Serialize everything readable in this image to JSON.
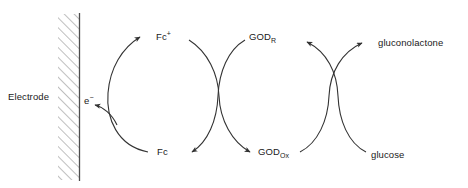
{
  "diagram": {
    "type": "reaction-cycle-diagram",
    "background_color": "#ffffff",
    "stroke_color": "#333333",
    "text_color": "#1a1a1a",
    "electrode": {
      "label": "Electrode",
      "style": "hatched-bar",
      "hatch_color": "#888888",
      "edge_color": "#555555"
    },
    "labels": {
      "electron": "e",
      "electron_charge": "−",
      "mediator_oxidized": "Fc",
      "mediator_oxidized_charge": "+",
      "mediator_reduced": "Fc",
      "enzyme_reduced": "GOD",
      "enzyme_reduced_sub": "R",
      "enzyme_oxidized": "GOD",
      "enzyme_oxidized_sub": "Ox",
      "product": "gluconolactone",
      "substrate": "glucose"
    },
    "cycles": [
      {
        "name": "mediator-cycle",
        "species": [
          "Fc+",
          "Fc"
        ],
        "direction": "counter-clockwise"
      },
      {
        "name": "enzyme-cycle",
        "species": [
          "GODR",
          "GODOx"
        ],
        "direction": "clockwise"
      },
      {
        "name": "substrate-cycle",
        "species": [
          "glucose",
          "gluconolactone"
        ],
        "direction": "crossing"
      }
    ],
    "arrows": [
      {
        "name": "electron-to-electrode",
        "from": "Fc",
        "to": "e-"
      },
      {
        "name": "fc-to-fc-plus",
        "from": "Fc",
        "to": "Fc+"
      },
      {
        "name": "fc-plus-to-god-ox",
        "from": "Fc+",
        "to": "GODOx"
      },
      {
        "name": "god-red-to-fc",
        "from": "GODR",
        "to": "Fc"
      },
      {
        "name": "glucose-to-god-red",
        "from": "glucose",
        "to": "GODR"
      },
      {
        "name": "god-ox-to-gluconolactone",
        "from": "GODOx",
        "to": "gluconolactone"
      }
    ]
  }
}
